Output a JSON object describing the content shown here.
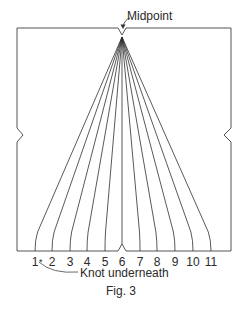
{
  "figure": {
    "caption": "Fig. 3",
    "midpoint_label": "Midpoint",
    "knot_label": "Knot underneath",
    "strand_count": 11,
    "strand_labels": [
      {
        "label": "1",
        "x": 35
      },
      {
        "label": "2",
        "x": 52
      },
      {
        "label": "3",
        "x": 70
      },
      {
        "label": "4",
        "x": 87
      },
      {
        "label": "5",
        "x": 105
      },
      {
        "label": "6",
        "x": 122
      },
      {
        "label": "7",
        "x": 140
      },
      {
        "label": "8",
        "x": 157
      },
      {
        "label": "9",
        "x": 175
      },
      {
        "label": "10",
        "x": 193
      },
      {
        "label": "11",
        "x": 211
      }
    ],
    "knot_marker": "*",
    "line_color": "#3a3a3a"
  }
}
